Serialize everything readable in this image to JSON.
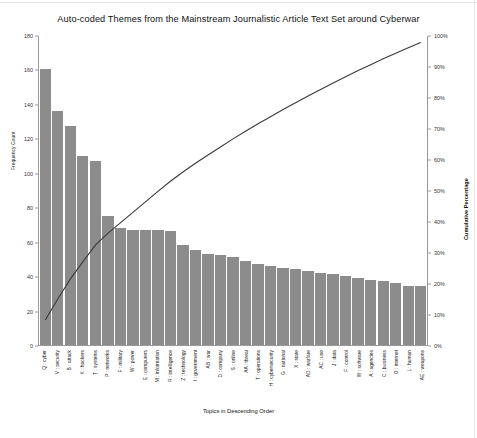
{
  "chart_data": {
    "type": "bar",
    "title": "Auto-coded Themes from the Mainstream Journalistic Article Text Set around Cyberwar",
    "xlabel": "Topics in Descending Order",
    "ylabel": "Frequency Count",
    "ylabel_secondary": "Cumulative Percentage",
    "ylim": [
      0,
      180
    ],
    "ylim_secondary": [
      0,
      100
    ],
    "yticks": [
      0,
      20,
      40,
      60,
      80,
      100,
      120,
      140,
      160,
      180
    ],
    "yticks_secondary": [
      "0%",
      "10%",
      "20%",
      "30%",
      "40%",
      "50%",
      "60%",
      "70%",
      "80%",
      "90%",
      "100%"
    ],
    "grid": false,
    "legend": "none",
    "bar_color": "#8c8c8c",
    "line_color": "#3a3a3a",
    "categories": [
      "Q : cyber",
      "V : security",
      "B : attack",
      "K : hackers",
      "T : systems",
      "P : networks",
      "F : military",
      "W : power",
      "E : computers",
      "M : information",
      "R : intelligence",
      "Z : technology",
      "I : government",
      "AB : war",
      "D : company",
      "S : online",
      "AA : threat",
      "T : operations",
      "H : cybersecurity",
      "G : national",
      "X : state",
      "AD : warfare",
      "AC : use",
      "J : data",
      "F : control",
      "W : software",
      "A : agencies",
      "C : business",
      "O : internet",
      "L : human",
      "AE : weapons"
    ],
    "values": [
      160,
      136,
      127,
      110,
      107,
      75,
      68,
      67,
      67,
      67,
      66,
      58,
      55,
      53,
      52,
      51,
      49,
      47,
      46,
      45,
      44,
      43,
      42,
      41,
      40,
      39,
      38,
      37,
      36,
      34,
      34
    ],
    "cumulative_percent": [
      8.1,
      14.9,
      21.3,
      26.9,
      32.3,
      36.1,
      39.5,
      42.9,
      46.3,
      49.7,
      53.0,
      56.0,
      58.8,
      61.5,
      64.1,
      66.7,
      69.2,
      71.6,
      73.9,
      76.2,
      78.4,
      80.6,
      82.7,
      84.8,
      86.8,
      88.8,
      90.7,
      92.6,
      94.4,
      96.2,
      97.9
    ],
    "series": [
      {
        "name": "Frequency Count",
        "type": "bar",
        "axis": "left"
      },
      {
        "name": "Cumulative Percentage",
        "type": "line",
        "axis": "right"
      }
    ]
  }
}
